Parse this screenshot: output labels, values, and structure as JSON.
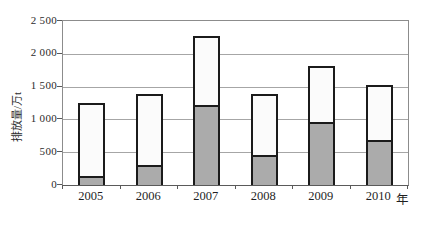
{
  "chart_data": {
    "type": "bar",
    "stacked": true,
    "title": "",
    "categories": [
      "2005",
      "2006",
      "2007",
      "2008",
      "2009",
      "2010"
    ],
    "series": [
      {
        "name": "lower-gray-segment",
        "color": "#ababab",
        "values": [
          130,
          300,
          1220,
          460,
          960,
          680
        ]
      },
      {
        "name": "upper-white-segment",
        "color": "#fbfbfb",
        "values": [
          1120,
          1080,
          1050,
          930,
          850,
          840
        ]
      }
    ],
    "totals": [
      1250,
      1380,
      2270,
      1390,
      1810,
      1520
    ],
    "ylabel": "排放量/万t",
    "xaxis_unit_suffix": "年",
    "ylim": [
      0,
      2500
    ],
    "ytick_interval": 500,
    "ytick_labels": [
      "0",
      "500",
      "1 000",
      "1 500",
      "2 000",
      "2 500"
    ],
    "grid": true,
    "legend": "none"
  },
  "colors": {
    "gridline": "#a6a6a6",
    "plot_border": "#8c8c8c",
    "bar_border": "#1b1b1b",
    "bar_gray_fill": "#ababab",
    "bar_white_fill": "#fbfbfb"
  }
}
